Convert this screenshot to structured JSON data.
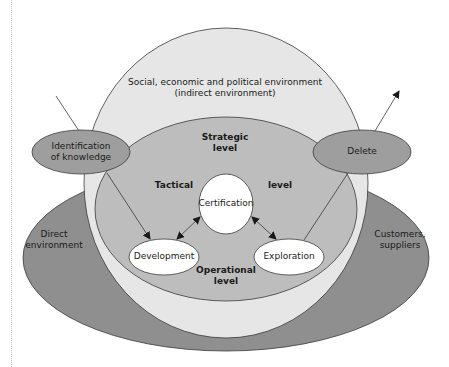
{
  "colors": {
    "indirect_environment": "#e6e6e6",
    "direct_environment": "#8f8f8f",
    "strategic_core": "#bdbdbd",
    "process_nodes": "#9e9e9e",
    "activity_nodes": "#ffffff",
    "stroke": "#3a3a3a"
  },
  "diagram": {
    "indirect_environment": {
      "line1": "Social, economic and political environment",
      "line2": "(indirect environment)"
    },
    "direct_environment": {
      "left_line1": "Direct",
      "left_line2": "environment",
      "right_line1": "Customers,",
      "right_line2": "suppliers"
    },
    "levels": {
      "strategic_line1": "Strategic",
      "strategic_line2": "level",
      "tactical_left": "Tactical",
      "tactical_right": "level",
      "operational_line1": "Operational",
      "operational_line2": "level"
    },
    "nodes": {
      "identification_line1": "Identification",
      "identification_line2": "of knowledge",
      "delete": "Delete",
      "certification": "Certification",
      "development": "Development",
      "exploration": "Exploration"
    }
  }
}
